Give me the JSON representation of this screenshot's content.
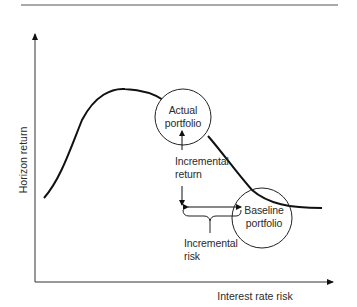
{
  "diagram": {
    "axes": {
      "x_label": "Interest rate risk",
      "y_label": "Horizon return"
    },
    "nodes": {
      "actual": {
        "line1": "Actual",
        "line2": "portfolio"
      },
      "baseline": {
        "line1": "Baseline",
        "line2": "portfolio"
      }
    },
    "annotations": {
      "incremental_return": {
        "line1": "Incremental",
        "line2": "return"
      },
      "incremental_risk": {
        "line1": "Incremental",
        "line2": "risk"
      }
    },
    "colors": {
      "line": "#111111",
      "text": "#2a2a2a",
      "rule": "#555555"
    }
  }
}
